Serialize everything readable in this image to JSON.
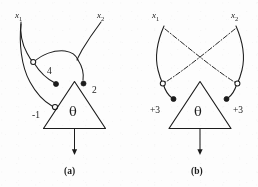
{
  "figure": {
    "kind": "scanned-diagram",
    "ink_color": "#1c1c1c",
    "background_color": "#fdfdfd"
  },
  "panels": [
    {
      "id": "a",
      "caption": "(a)",
      "threshold_symbol": "θ",
      "inputs": [
        {
          "name": "x",
          "subscript": "1"
        },
        {
          "name": "x",
          "subscript": "2"
        }
      ],
      "weights": [
        {
          "label": "4",
          "terminal": "filled"
        },
        {
          "label": "2",
          "terminal": "filled"
        },
        {
          "label": "-1",
          "terminal": "open"
        }
      ],
      "junction_terminal": "open",
      "output": "arrow-down"
    },
    {
      "id": "b",
      "caption": "(b)",
      "threshold_symbol": "θ",
      "inputs": [
        {
          "name": "x",
          "subscript": "1"
        },
        {
          "name": "x",
          "subscript": "2"
        }
      ],
      "weights": [
        {
          "label": "+3",
          "terminal": "filled"
        },
        {
          "label": "+3",
          "terminal": "filled"
        }
      ],
      "junction_terminal": "open",
      "output": "arrow-down"
    }
  ]
}
